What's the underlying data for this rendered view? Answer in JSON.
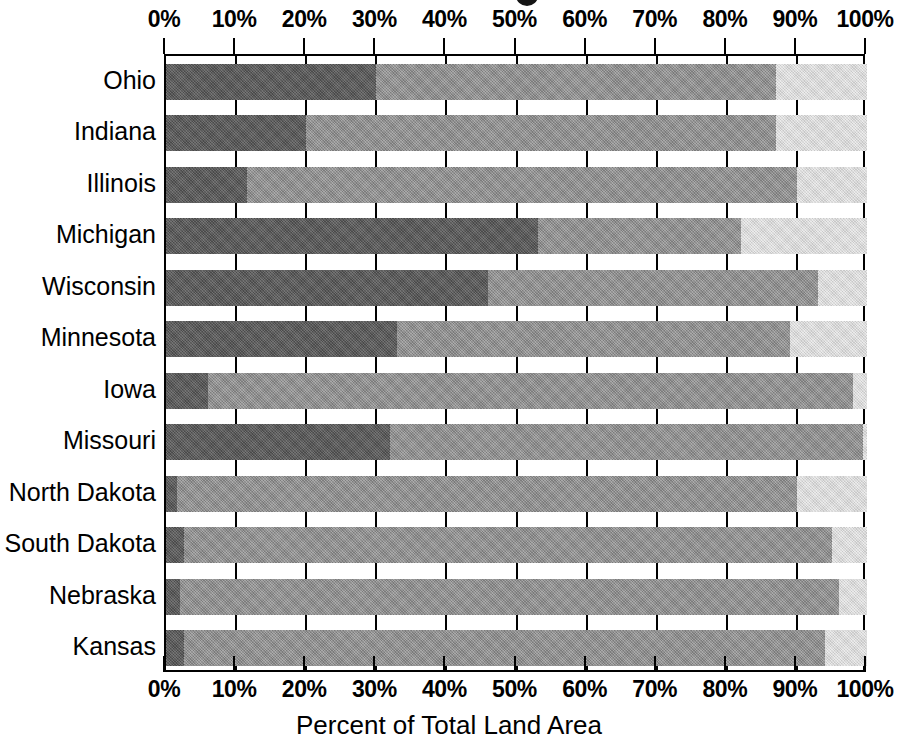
{
  "chart_data": {
    "type": "bar",
    "subtype": "stacked-horizontal-100percent",
    "title": "",
    "xlabel": "Percent of Total Land Area",
    "ylabel": "",
    "xlim": [
      0,
      100
    ],
    "xticks": [
      0,
      10,
      20,
      30,
      40,
      50,
      60,
      70,
      80,
      90,
      100
    ],
    "xtick_labels": [
      "0%",
      "10%",
      "20%",
      "30%",
      "40%",
      "50%",
      "60%",
      "70%",
      "80%",
      "90%",
      "100%"
    ],
    "xtick_labels_top": [
      "0%",
      "10%",
      "20%",
      "30%",
      "40%",
      "50%",
      "60%",
      "70%",
      "80%",
      "90%",
      "100%"
    ],
    "grid": true,
    "legend": "none",
    "categories": [
      "Ohio",
      "Indiana",
      "Illinois",
      "Michigan",
      "Wisconsin",
      "Minnesota",
      "Iowa",
      "Missouri",
      "North Dakota",
      "South Dakota",
      "Nebraska",
      "Kansas"
    ],
    "series": [
      {
        "name": "segment-a",
        "color": "#585858",
        "values": [
          30.0,
          20.0,
          11.5,
          53.0,
          46.0,
          33.0,
          6.0,
          32.0,
          1.5,
          2.5,
          2.0,
          2.5
        ]
      },
      {
        "name": "segment-b",
        "color": "#939393",
        "values": [
          57.0,
          67.0,
          78.5,
          29.0,
          47.0,
          56.0,
          92.0,
          67.5,
          88.5,
          92.5,
          94.0,
          91.5
        ]
      },
      {
        "name": "segment-c",
        "color": "#dcdcdc",
        "values": [
          13.0,
          13.0,
          10.0,
          18.0,
          7.0,
          11.0,
          2.0,
          0.5,
          10.0,
          5.0,
          4.0,
          6.0
        ]
      }
    ],
    "cumulative_boundaries": [
      [
        30.0,
        87.0
      ],
      [
        20.0,
        87.0
      ],
      [
        11.5,
        90.0
      ],
      [
        53.0,
        82.0
      ],
      [
        46.0,
        93.0
      ],
      [
        33.0,
        89.0
      ],
      [
        6.0,
        98.0
      ],
      [
        32.0,
        99.5
      ],
      [
        1.5,
        90.0
      ],
      [
        2.5,
        95.0
      ],
      [
        2.0,
        96.0
      ],
      [
        2.5,
        94.0
      ]
    ]
  }
}
